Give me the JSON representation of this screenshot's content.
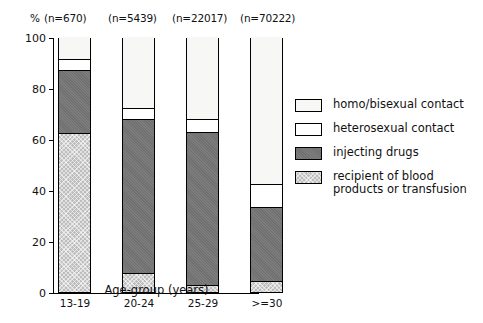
{
  "chart_data": {
    "type": "bar",
    "subtype": "stacked-bar-100-percent",
    "title": "",
    "xlabel": "Age-group (years)",
    "ylabel": "%",
    "ylim": [
      0,
      100
    ],
    "yticks": [
      0,
      20,
      40,
      60,
      80,
      100
    ],
    "grid": false,
    "legend_position": "right",
    "categories": [
      "13-19",
      "20-24",
      "25-29",
      ">=30"
    ],
    "category_counts": [
      "(n=670)",
      "(n=5439)",
      "(n=22017)",
      "(n=70222)"
    ],
    "sample_sizes": [
      670,
      5439,
      22017,
      70222
    ],
    "stack_order_bottom_to_top": [
      "recipient of blood products or transfusion",
      "injecting drugs",
      "heterosexual contact",
      "homo/bisexual contact"
    ],
    "series": [
      {
        "name": "recipient of blood products or transfusion",
        "key": "blood",
        "values": [
          62,
          7,
          2.5,
          4
        ]
      },
      {
        "name": "injecting drugs",
        "key": "inject",
        "values": [
          24.5,
          60.5,
          60,
          29
        ]
      },
      {
        "name": "heterosexual contact",
        "key": "hetero",
        "values": [
          5,
          4.5,
          5.5,
          9.5
        ]
      },
      {
        "name": "homo/bisexual contact",
        "key": "homo",
        "values": [
          8.5,
          28,
          32,
          57.5
        ]
      }
    ],
    "cumulative_tops": {
      "blood": [
        62,
        7,
        2.5,
        4
      ],
      "inject": [
        86.5,
        67.5,
        62.5,
        33
      ],
      "hetero": [
        91.5,
        72,
        68,
        42.5
      ],
      "homo": [
        100,
        100,
        100,
        100
      ]
    }
  },
  "axes": {
    "percent_symbol": "%",
    "y_tick_labels": [
      "0",
      "20",
      "40",
      "60",
      "80",
      "100"
    ],
    "x_tick_labels": [
      "13-19",
      "20-24",
      "25-29",
      ">=30"
    ],
    "x_axis_title": "Age-group (years)"
  },
  "legend": {
    "items": [
      {
        "swatch": "homo",
        "label": "homo/bisexual contact"
      },
      {
        "swatch": "hetero",
        "label": "heterosexual contact"
      },
      {
        "swatch": "inject",
        "label": "injecting drugs"
      },
      {
        "swatch": "blood",
        "label": "recipient of blood\nproducts or transfusion"
      }
    ]
  },
  "colors": {
    "axis": "#000000",
    "homo": "#f7f7f5",
    "hetero": "#ffffff",
    "inject": "#767676",
    "blood": "#bdbdbd",
    "background": "#ffffff"
  }
}
